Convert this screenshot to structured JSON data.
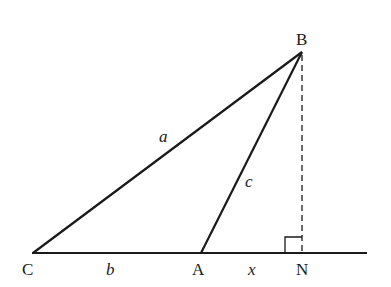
{
  "diagram": {
    "type": "geometry-triangle",
    "points": {
      "C": {
        "label": "C",
        "x": 33,
        "y": 253
      },
      "A": {
        "label": "A",
        "x": 201,
        "y": 253
      },
      "B": {
        "label": "B",
        "x": 302,
        "y": 52
      },
      "N": {
        "label": "N",
        "x": 302,
        "y": 253
      }
    },
    "sides": {
      "a": "a",
      "b": "b",
      "c": "c",
      "x": "x"
    },
    "right_angle_at": "N",
    "stroke_color": "#1a1a1a"
  }
}
